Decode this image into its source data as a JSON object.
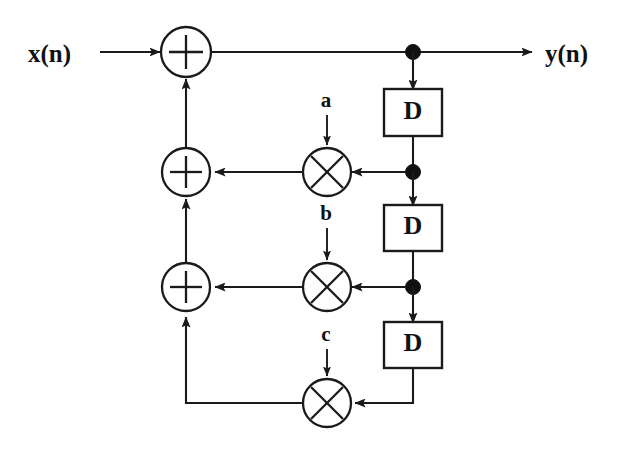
{
  "diagram": {
    "input_label": "x(n)",
    "output_label": "y(n)",
    "delay_label": "D",
    "coefficients": [
      {
        "name": "a",
        "label": "a"
      },
      {
        "name": "b",
        "label": "b"
      },
      {
        "name": "c",
        "label": "c"
      }
    ],
    "delays": [
      {
        "label": "D"
      },
      {
        "label": "D"
      },
      {
        "label": "D"
      }
    ],
    "adders": [
      {
        "name": "adder-top",
        "glyph": "plus"
      },
      {
        "name": "adder-middle",
        "glyph": "plus"
      },
      {
        "name": "adder-lower",
        "glyph": "plus"
      }
    ],
    "multipliers": [
      {
        "name": "multiplier-a",
        "glyph": "times"
      },
      {
        "name": "multiplier-b",
        "glyph": "times"
      },
      {
        "name": "multiplier-c",
        "glyph": "times"
      }
    ],
    "colors": {
      "line": "#1a1a1a",
      "dot": "#111111",
      "background": "#ffffff",
      "text": "#111111"
    }
  }
}
